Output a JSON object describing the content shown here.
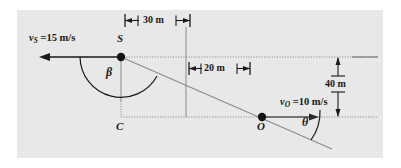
{
  "figure": {
    "background_color": "#ffffff",
    "panel_color": "#e8e8e8"
  },
  "points": [
    {
      "id": "S",
      "label": "S",
      "x": 121,
      "y": 57,
      "label_x": 117,
      "label_y": 38
    },
    {
      "id": "C",
      "label": "C",
      "x": 121,
      "y": 117,
      "label_x": 117,
      "label_y": 124
    },
    {
      "id": "O",
      "label": "O",
      "x": 262,
      "y": 117,
      "label_x": 258,
      "label_y": 124
    }
  ],
  "velocities": {
    "source": {
      "symbol": "v",
      "subscript": "S",
      "equals_value": " =15 m/s",
      "full_text": "v_S =15 m/s",
      "label_x": 30,
      "label_y": 35,
      "direction": "left"
    },
    "observer": {
      "symbol": "v",
      "subscript": "O",
      "equals_value": " =10 m/s",
      "full_text": "v_O =10 m/s",
      "label_x": 281,
      "label_y": 99,
      "direction": "right"
    }
  },
  "dimensions": [
    {
      "id": "horizontal-30m",
      "label": "30 m",
      "value": 30,
      "unit": "m",
      "label_x": 148,
      "label_y": 20,
      "orientation": "horizontal"
    },
    {
      "id": "horizontal-20m",
      "label": "20 m",
      "value": 20,
      "unit": "m",
      "label_x": 206,
      "label_y": 68,
      "orientation": "horizontal"
    },
    {
      "id": "vertical-40m",
      "label": "40 m",
      "value": 40,
      "unit": "m",
      "label_x": 345,
      "label_y": 84,
      "orientation": "vertical"
    }
  ],
  "angles": [
    {
      "id": "beta",
      "label": "β",
      "label_x": 109,
      "label_y": 72,
      "vertex": "S"
    },
    {
      "id": "theta",
      "label": "θ",
      "label_x": 305,
      "label_y": 122,
      "vertex": "O"
    }
  ],
  "colors": {
    "stroke_dark": "#1a1a1a",
    "stroke_gray": "#8a8a8a",
    "panel": "#e8e8e8"
  }
}
